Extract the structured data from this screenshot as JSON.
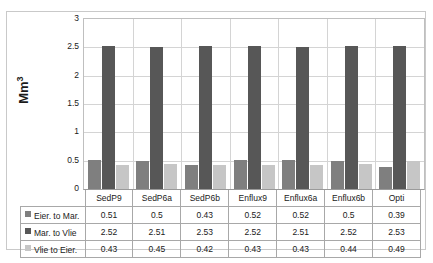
{
  "chart_data": {
    "type": "bar",
    "title": "",
    "xlabel": "",
    "ylabel": "Mm³",
    "ylim": [
      0,
      3
    ],
    "yticks": [
      "0",
      "0.5",
      "1",
      "1.5",
      "2",
      "2.5",
      "3"
    ],
    "grid": true,
    "legend_position": "data-table",
    "categories": [
      "SedP9",
      "SedP6a",
      "SedP6b",
      "Enflux9",
      "Enflux6a",
      "Enflux6b",
      "Opti"
    ],
    "series": [
      {
        "name": "Eier. to Mar.",
        "color": "#7f7f7f",
        "values": [
          0.51,
          0.5,
          0.43,
          0.52,
          0.52,
          0.5,
          0.39
        ],
        "labels": [
          "0.51",
          "0.5",
          "0.43",
          "0.52",
          "0.52",
          "0.5",
          "0.39"
        ]
      },
      {
        "name": "Mar. to Vlie",
        "color": "#575757",
        "values": [
          2.52,
          2.51,
          2.53,
          2.52,
          2.51,
          2.52,
          2.53
        ],
        "labels": [
          "2.52",
          "2.51",
          "2.53",
          "2.52",
          "2.51",
          "2.52",
          "2.53"
        ]
      },
      {
        "name": "Vlie to Eier.",
        "color": "#c6c6c6",
        "values": [
          0.43,
          0.45,
          0.42,
          0.43,
          0.43,
          0.44,
          0.49
        ],
        "labels": [
          "0.43",
          "0.45",
          "0.42",
          "0.43",
          "0.43",
          "0.44",
          "0.49"
        ]
      }
    ]
  },
  "axis": {
    "y_title_main": "Mm",
    "y_title_sup": "3"
  }
}
